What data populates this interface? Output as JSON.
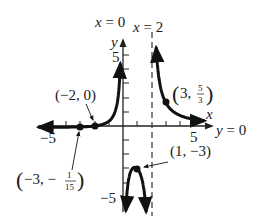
{
  "chart_data": {
    "type": "line",
    "title": "",
    "function": "f(x) = (x + 2) / (x^2 - 2x)",
    "xlabel": "x",
    "ylabel": "y",
    "xlim": [
      -6,
      6
    ],
    "ylim": [
      -6,
      6
    ],
    "x_ticks": [
      -5,
      -4,
      -3,
      -2,
      -1,
      1,
      2,
      3,
      4,
      5
    ],
    "y_ticks": [
      -5,
      -4,
      -3,
      -2,
      -1,
      1,
      2,
      3,
      4,
      5
    ],
    "x_tick_labels": [
      {
        "value": -5,
        "label": "−5"
      },
      {
        "value": 5,
        "label": "5"
      }
    ],
    "y_tick_labels": [
      {
        "value": 5,
        "label": "5"
      },
      {
        "value": -5,
        "label": "−5"
      }
    ],
    "grid": false,
    "asymptotes": {
      "vertical": [
        {
          "x": 0,
          "label": "x = 0",
          "style": "axis"
        },
        {
          "x": 2,
          "label": "x = 2",
          "style": "dashed"
        }
      ],
      "horizontal": [
        {
          "y": 0,
          "label": "y = 0",
          "style": "axis"
        }
      ]
    },
    "branches": [
      {
        "name": "left",
        "x_range": [
          -6,
          -0.15
        ],
        "points": [
          [
            -6,
            -0.083
          ],
          [
            -5,
            -0.086
          ],
          [
            -4,
            -0.083
          ],
          [
            -3,
            -0.067
          ],
          [
            -2,
            0
          ],
          [
            -1,
            0.333
          ],
          [
            -0.5,
            1.2
          ],
          [
            -0.3,
            2.32
          ],
          [
            -0.2,
            4.09
          ]
        ]
      },
      {
        "name": "middle",
        "x_range": [
          0.18,
          1.8
        ],
        "points": [
          [
            0.25,
            -5.14
          ],
          [
            0.5,
            -3.33
          ],
          [
            1,
            -3
          ],
          [
            1.5,
            -4.67
          ],
          [
            1.75,
            -6.0
          ]
        ]
      },
      {
        "name": "right",
        "x_range": [
          2.15,
          6
        ],
        "points": [
          [
            2.2,
            9.55
          ],
          [
            2.5,
            3.6
          ],
          [
            3,
            1.667
          ],
          [
            4,
            0.75
          ],
          [
            5,
            0.467
          ],
          [
            6,
            0.333
          ]
        ]
      }
    ],
    "labeled_points": [
      {
        "x": -2,
        "y": 0,
        "label": "(−2, 0)"
      },
      {
        "x": -3,
        "y": -0.0667,
        "label": "(−3, −1/15)"
      },
      {
        "x": 1,
        "y": -3,
        "label": "(1, −3)"
      },
      {
        "x": 3,
        "y": 1.6667,
        "label": "(3, 5/3)"
      }
    ]
  },
  "labels": {
    "asymptote_x0": "x = 0",
    "asymptote_x2": "x = 2",
    "asymptote_y0": "y = 0",
    "axis_x": "x",
    "axis_y": "y",
    "tick_x_neg5": "−5",
    "tick_x_5": "5",
    "tick_y_5": "5",
    "tick_y_neg5": "−5",
    "point_neg2_0": "(−2, 0)",
    "point_neg3_open": "(−3, −",
    "point_neg3_num": "1",
    "point_neg3_den": "15",
    "point_neg3_close": ")",
    "point_1_neg3": "(1, −3)",
    "point_3_open": "(3,",
    "point_3_num": "5",
    "point_3_den": "3",
    "point_3_close": ")"
  },
  "colors": {
    "curve": "#111111",
    "axis": "#222222",
    "asymptote": "#333333",
    "background": "#ffffff"
  }
}
